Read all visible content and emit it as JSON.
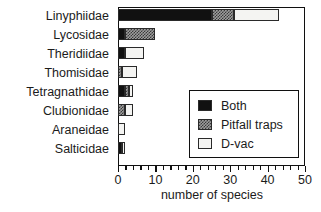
{
  "chart_data": {
    "type": "bar",
    "orientation": "horizontal",
    "stacked": true,
    "title": "",
    "xlabel": "number of species",
    "ylabel": "",
    "xlim": [
      0,
      50
    ],
    "xticks": [
      0,
      10,
      20,
      30,
      40,
      50
    ],
    "xtick_labels": [
      "0",
      "10",
      "20",
      "30",
      "40",
      "50"
    ],
    "minor_tick_step": 2,
    "grid": false,
    "legend_position": "center-right",
    "categories": [
      "Linyphiidae",
      "Lycosidae",
      "Theridiidae",
      "Thomisidae",
      "Tetragnathidae",
      "Clubionidae",
      "Araneidae",
      "Salticidae"
    ],
    "series": [
      {
        "name": "Both",
        "color": "#111111",
        "values": [
          25,
          2,
          2,
          0,
          2,
          0,
          0,
          1
        ]
      },
      {
        "name": "Pitfall traps",
        "color": "#9d9d9d",
        "values": [
          6,
          8,
          0,
          1,
          1,
          2,
          0,
          0
        ]
      },
      {
        "name": "D-vac",
        "color": "#f4f4f2",
        "values": [
          12,
          0,
          5,
          4,
          1,
          2,
          2,
          1
        ]
      }
    ],
    "totals": [
      43,
      10,
      7,
      5,
      4,
      4,
      2,
      2
    ]
  },
  "legend": {
    "entries": [
      {
        "label": "Both",
        "swatch": "solid-black-swatch"
      },
      {
        "label": "Pitfall traps",
        "swatch": "checkered-gray-swatch"
      },
      {
        "label": "D-vac",
        "swatch": "white-swatch"
      }
    ]
  }
}
